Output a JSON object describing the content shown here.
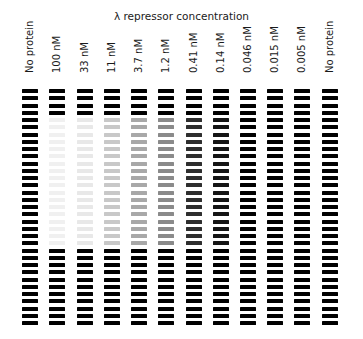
{
  "figure": {
    "title": "λ repressor concentration",
    "band_rows": 33,
    "protected_rows": {
      "start": 4,
      "end": 21
    },
    "lanes": [
      {
        "label": "No protein",
        "protected_color": "#000000"
      },
      {
        "label": "100 nM",
        "protected_color": "#f0f0f0"
      },
      {
        "label": "33 nM",
        "protected_color": "#e8e8e8"
      },
      {
        "label": "11 nM",
        "protected_color": "#c8c8c8"
      },
      {
        "label": "3.7 nM",
        "protected_color": "#a8a8a8"
      },
      {
        "label": "1.2 nM",
        "protected_color": "#8a8a8a"
      },
      {
        "label": "0.41 nM",
        "protected_color": "#2e2e2e"
      },
      {
        "label": "0.14 nM",
        "protected_color": "#151515"
      },
      {
        "label": "0.046 nM",
        "protected_color": "#000000"
      },
      {
        "label": "0.015 nM",
        "protected_color": "#000000"
      },
      {
        "label": "0.005 nM",
        "protected_color": "#000000"
      },
      {
        "label": "No protein",
        "protected_color": "#000000"
      }
    ],
    "band_color": "#000000"
  }
}
